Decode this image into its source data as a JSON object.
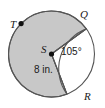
{
  "figure": {
    "type": "circle-diagram",
    "colors": {
      "shaded_fill": "#c8c8c8",
      "unshaded_fill": "#ffffff",
      "stroke": "#555555",
      "point_marker": "#111111",
      "text": "#1a1a1a",
      "background": "#ffffff"
    },
    "geometry": {
      "center_x": 51.5,
      "center_y": 54,
      "radius_px": 43,
      "angle_Q_deg": 36,
      "angle_R_deg": -69,
      "angle_T_deg": 135,
      "central_angle_deg": 105
    },
    "labels": {
      "center": "S",
      "point_q": "Q",
      "point_r": "R",
      "point_t": "T",
      "angle": "105°",
      "radius": "8 in."
    }
  }
}
